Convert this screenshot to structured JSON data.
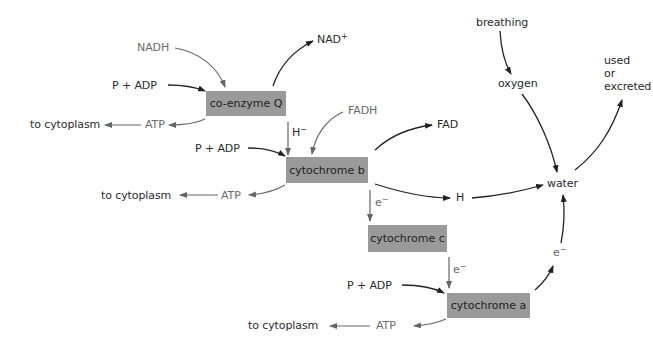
{
  "colors": {
    "box_fill": "#9a9a9a",
    "dark_arrow": "#222222",
    "gray_arrow": "#666666",
    "background": "#ffffff"
  },
  "boxes": {
    "coenzyme_q": "co-enzyme Q",
    "cytochrome_b": "cytochrome b",
    "cytochrome_c": "cytochrome c",
    "cytochrome_a": "cytochrome a"
  },
  "labels": {
    "nadh": "NADH",
    "nad_plus": "NAD",
    "nad_plus_sup": "+",
    "fadh": "FADH",
    "fad": "FAD",
    "p_adp_1": "P  +  ADP",
    "p_adp_2": "P  +  ADP",
    "p_adp_3": "P  +  ADP",
    "atp_1": "ATP",
    "atp_2": "ATP",
    "atp_3": "ATP",
    "to_cytoplasm_1": "to cytoplasm",
    "to_cytoplasm_2": "to cytoplasm",
    "to_cytoplasm_3": "to cytoplasm",
    "h_minus": "H",
    "h_minus_sup": "−",
    "e_minus_1": "e",
    "e_minus_1_sup": "−",
    "e_minus_2": "e",
    "e_minus_2_sup": "−",
    "e_minus_3": "e",
    "e_minus_3_sup": "−",
    "h": "H",
    "water": "water",
    "breathing": "breathing",
    "oxygen": "oxygen",
    "used": "used",
    "or": "or",
    "excreted": "excreted"
  }
}
